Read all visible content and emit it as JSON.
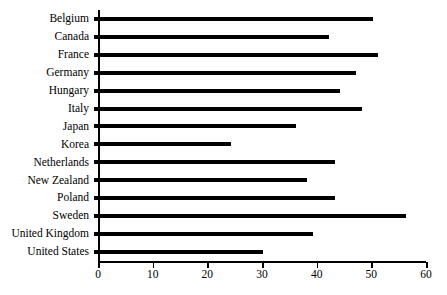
{
  "chart_data": {
    "type": "bar",
    "orientation": "horizontal",
    "title": "",
    "subtitle": "",
    "xlabel": "",
    "ylabel": "",
    "xlim": [
      0,
      60
    ],
    "xticks": [
      0,
      10,
      20,
      30,
      40,
      50,
      60
    ],
    "grid": false,
    "legend": null,
    "bar_color": "#000000",
    "axis_color": "#000000",
    "background_color": "#ffffff",
    "categories": [
      "Belgium",
      "Canada",
      "France",
      "Germany",
      "Hungary",
      "Italy",
      "Japan",
      "Korea",
      "Netherlands",
      "New Zealand",
      "Poland",
      "Sweden",
      "United Kingdom",
      "United States"
    ],
    "values": [
      51,
      43,
      52,
      48,
      45,
      49,
      37,
      25,
      44,
      39,
      44,
      57,
      40,
      31
    ],
    "series": [
      {
        "name": "",
        "values": [
          51,
          43,
          52,
          48,
          45,
          49,
          37,
          25,
          44,
          39,
          44,
          57,
          40,
          31
        ]
      }
    ]
  }
}
